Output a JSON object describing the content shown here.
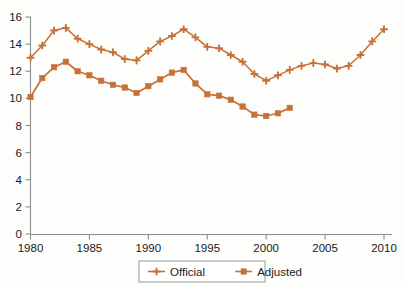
{
  "chart_data": {
    "type": "line",
    "title": "",
    "subtitle": "",
    "xlabel": "",
    "ylabel": "",
    "xlim": [
      1980,
      2010
    ],
    "ylim": [
      0,
      16
    ],
    "grid": false,
    "legend_position": "bottom-center",
    "accent_color": "#c87137",
    "axis_color": "#8d8d8d",
    "text_color": "#1b1b1b",
    "background_color": "#fdfdfb",
    "x_ticks": [
      1980,
      1985,
      1990,
      1995,
      2000,
      2005,
      2010
    ],
    "x_tick_labels": [
      "1980",
      "1985",
      "1990",
      "1995",
      "2000",
      "2005",
      "2010"
    ],
    "y_ticks": [
      0,
      2,
      4,
      6,
      8,
      10,
      12,
      14,
      16
    ],
    "y_tick_labels": [
      "0",
      "2",
      "4",
      "6",
      "8",
      "10",
      "12",
      "14",
      "16"
    ],
    "series": [
      {
        "name": "Official",
        "marker": "plus",
        "color": "#c87137",
        "x": [
          1980,
          1981,
          1982,
          1983,
          1984,
          1985,
          1986,
          1987,
          1988,
          1989,
          1990,
          1991,
          1992,
          1993,
          1994,
          1995,
          1996,
          1997,
          1998,
          1999,
          2000,
          2001,
          2002,
          2003,
          2004,
          2005,
          2006,
          2007,
          2008,
          2009,
          2010
        ],
        "values": [
          13.0,
          13.9,
          15.0,
          15.2,
          14.4,
          14.0,
          13.6,
          13.4,
          12.9,
          12.8,
          13.5,
          14.2,
          14.6,
          15.1,
          14.5,
          13.8,
          13.7,
          13.2,
          12.7,
          11.8,
          11.3,
          11.7,
          12.1,
          12.4,
          12.6,
          12.5,
          12.2,
          12.4,
          13.2,
          14.2,
          15.1
        ]
      },
      {
        "name": "Adjusted",
        "marker": "square",
        "color": "#c87137",
        "x": [
          1980,
          1981,
          1982,
          1983,
          1984,
          1985,
          1986,
          1987,
          1988,
          1989,
          1990,
          1991,
          1992,
          1993,
          1994,
          1995,
          1996,
          1997,
          1998,
          1999,
          2000,
          2001,
          2002
        ],
        "values": [
          10.1,
          11.5,
          12.3,
          12.7,
          12.0,
          11.7,
          11.3,
          11.0,
          10.8,
          10.4,
          10.9,
          11.4,
          11.9,
          12.1,
          11.1,
          10.3,
          10.2,
          9.9,
          9.4,
          8.8,
          8.7,
          8.9,
          9.3
        ]
      }
    ],
    "legend": [
      {
        "label": "Official",
        "marker": "plus",
        "color": "#c87137"
      },
      {
        "label": "Adjusted",
        "marker": "square",
        "color": "#c87137"
      }
    ]
  }
}
